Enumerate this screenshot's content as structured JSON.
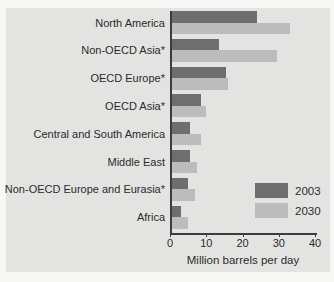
{
  "figure": {
    "background_color": "#f7f7f5",
    "panel_color": "#e3e3e1",
    "axis_color": "#3c3c3c",
    "text_color": "#2b2b2b"
  },
  "chart_data": {
    "type": "bar",
    "orientation": "horizontal",
    "title": "",
    "xlabel": "Million barrels per day",
    "ylabel": "",
    "xlim": [
      0,
      40
    ],
    "xticks": [
      0,
      10,
      20,
      30,
      40
    ],
    "grid": false,
    "legend_position": "lower right",
    "categories": [
      "North America",
      "Non-OECD Asia*",
      "OECD Europe*",
      "OECD Asia*",
      "Central and South America",
      "Middle East",
      "Non-OECD Europe and Eurasia*",
      "Africa"
    ],
    "series": [
      {
        "name": "2003",
        "color": "#6e6e6e",
        "values": [
          24,
          13.5,
          15.5,
          8.5,
          5.5,
          5.5,
          5,
          3
        ]
      },
      {
        "name": "2030",
        "color": "#bcbcbc",
        "values": [
          33,
          29.5,
          16,
          10,
          8.5,
          7.5,
          7,
          5
        ]
      }
    ]
  }
}
